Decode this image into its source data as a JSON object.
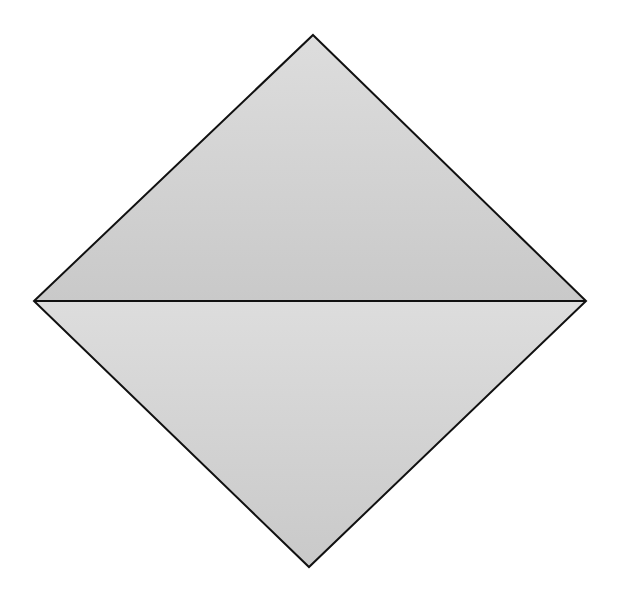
{
  "diagram": {
    "shape": "rhombus",
    "vertices": {
      "top": [
        313,
        35
      ],
      "right": [
        586,
        301
      ],
      "bottom": [
        309,
        567
      ],
      "left": [
        34,
        301
      ]
    },
    "diagonal": "horizontal",
    "colors": {
      "fill_top": "#dddddd",
      "fill_bottom": "#c9c9c9",
      "stroke": "#111111",
      "background": "#ffffff"
    },
    "stroke_width": 2
  }
}
